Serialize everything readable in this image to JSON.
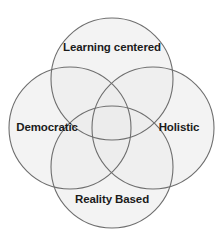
{
  "diagram": {
    "type": "venn",
    "title": "",
    "set_count": 4,
    "background_color": "#ffffff",
    "circle_stroke_color": "#6e6e6e",
    "circle_fill_color": "#ebebeb",
    "circle_fill_opacity": 0.62,
    "label_color": "#1b1b1b",
    "circles": [
      {
        "id": "learning-centered",
        "label": "Learning centered",
        "position": "top",
        "cx": 112,
        "cy": 79,
        "r": 61
      },
      {
        "id": "democratic",
        "label": "Democratic",
        "position": "left",
        "cx": 70,
        "cy": 128,
        "r": 61
      },
      {
        "id": "holistic",
        "label": "Holistic",
        "position": "right",
        "cx": 153,
        "cy": 128,
        "r": 61
      },
      {
        "id": "reality-based",
        "label": "Reality Based",
        "position": "bottom",
        "cx": 112,
        "cy": 167,
        "r": 61
      }
    ],
    "labels": {
      "top": "Learning centered",
      "left": "Democratic",
      "right": "Holistic",
      "bottom": "Reality Based"
    }
  }
}
